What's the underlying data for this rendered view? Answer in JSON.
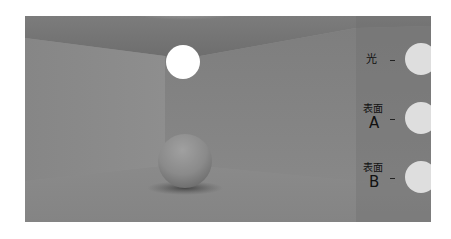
{
  "figure": {
    "colors": {
      "wall": "#8a8a8a",
      "ceiling": "#7a7a7a",
      "floor": "#858585",
      "light": "#ffffff",
      "swatch": "#dedede",
      "label": "#111111"
    }
  },
  "legend": {
    "items": [
      {
        "label_top": "光",
        "label_bottom": "",
        "name": "light"
      },
      {
        "label_top": "表面",
        "label_bottom": "A",
        "name": "surface-a"
      },
      {
        "label_top": "表面",
        "label_bottom": "B",
        "name": "surface-b"
      }
    ]
  }
}
